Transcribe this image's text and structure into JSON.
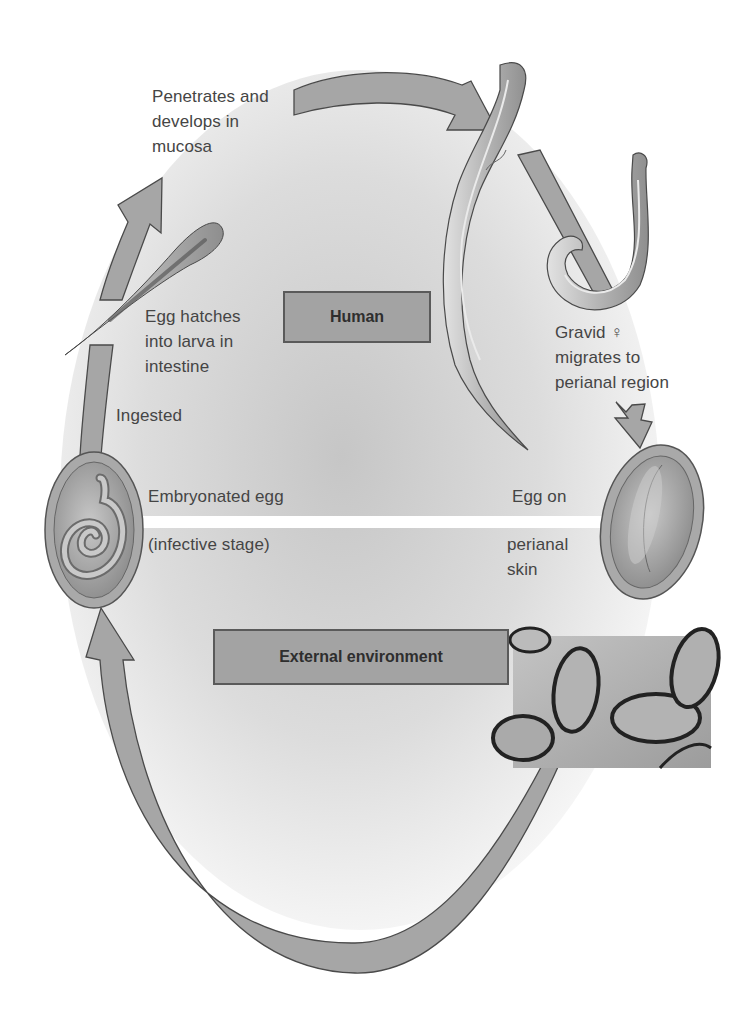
{
  "regions": {
    "human": "Human",
    "external": "External environment"
  },
  "labels": {
    "penetrates": [
      "Penetrates and",
      "develops in",
      "mucosa"
    ],
    "hatches": [
      "Egg hatches",
      "into larva in",
      "intestine"
    ],
    "ingested": "Ingested",
    "embryonated": [
      "Embryonated egg",
      "(infective stage)"
    ],
    "egg_on_skin": [
      "Egg on",
      "perianal",
      "skin"
    ],
    "gravid": [
      "Gravid ♀",
      "migrates to",
      "perianal region"
    ]
  },
  "colors": {
    "arrow_fill": "#a6a6a6",
    "arrow_stroke": "#4a4a4a",
    "box_fill": "#a3a3a3",
    "text": "#454545",
    "background_center": "#c9c9c9"
  },
  "illustrations": {
    "adult_worms": "adult-pinworms-icon",
    "larva": "larva-icon",
    "embryonated_egg": "embryonated-egg-icon",
    "perianal_egg": "perianal-egg-icon",
    "micrograph": "egg-micrograph"
  }
}
